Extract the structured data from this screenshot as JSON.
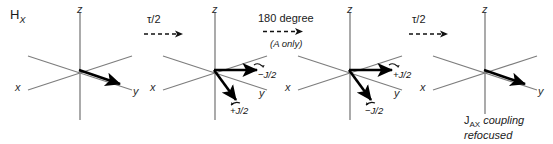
{
  "figure": {
    "title_label": "H",
    "title_sub": "X",
    "width": 553,
    "height": 144,
    "background": "#ffffff",
    "axis_color": "#7d7d7d",
    "vector_color": "#000000",
    "text_color": "#1a1a1a"
  },
  "steps": [
    {
      "name": "tau-over-two-first",
      "label": "τ/2",
      "sublabel": "",
      "arrow": "dashed-right-arrow"
    },
    {
      "name": "one-eighty-degree",
      "label": "180 degree",
      "sublabel": "(A only)",
      "arrow": "dashed-right-arrow"
    },
    {
      "name": "tau-over-two-second",
      "label": "τ/2",
      "sublabel": "",
      "arrow": "dashed-right-arrow"
    }
  ],
  "panels": [
    {
      "name": "panel-initial",
      "axes": {
        "z": "z",
        "x": "x",
        "y": "y"
      },
      "vectors": [
        {
          "name": "magnetization-vector-y",
          "label": ""
        }
      ],
      "annotations": []
    },
    {
      "name": "panel-after-first-delay",
      "axes": {
        "z": "z",
        "x": "x",
        "y": "y"
      },
      "vectors": [
        {
          "name": "vector-minus-j-over-2",
          "label": "−J/2"
        },
        {
          "name": "vector-plus-j-over-2",
          "label": "+J/2"
        }
      ],
      "annotations": [
        {
          "name": "label-minus-j-over-2",
          "text": "−J/2",
          "sign": "−",
          "value": "J/2"
        },
        {
          "name": "label-plus-j-over-2",
          "text": "+J/2",
          "sign": "+",
          "value": "J/2"
        }
      ]
    },
    {
      "name": "panel-after-180-pulse",
      "axes": {
        "z": "z",
        "x": "x",
        "y": "y"
      },
      "vectors": [
        {
          "name": "vector-plus-j-over-2",
          "label": "+J/2"
        },
        {
          "name": "vector-minus-j-over-2",
          "label": "−J/2"
        }
      ],
      "annotations": [
        {
          "name": "label-plus-j-over-2",
          "text": "+J/2",
          "sign": "+",
          "value": "J/2"
        },
        {
          "name": "label-minus-j-over-2",
          "text": "−J/2",
          "sign": "−",
          "value": "J/2"
        }
      ]
    },
    {
      "name": "panel-refocused",
      "axes": {
        "z": "z",
        "x": "x",
        "y": "y"
      },
      "vectors": [
        {
          "name": "magnetization-vector-y",
          "label": ""
        }
      ],
      "annotations": [],
      "caption": {
        "j_symbol": "J",
        "j_subscript": "AX",
        "line1_rest": " coupling",
        "line2": "refocused"
      }
    }
  ]
}
